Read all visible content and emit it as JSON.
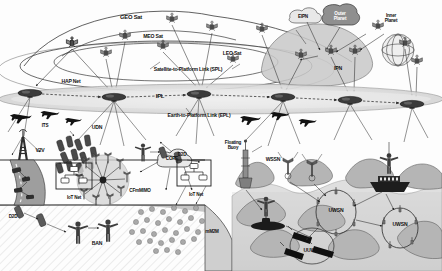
{
  "diagram": {
    "background_color": "#ffffff",
    "ink_color": "#1a1a1a",
    "band_fill": "#d8d8d8",
    "water_fill": "#bdbdbd",
    "cloud_fill": "#9a9a9a"
  },
  "labels": {
    "geo_sat": "GEO Sat",
    "meo_sat": "MEO Sat",
    "leo_sat": "LEO Sat",
    "spl": "Satellite-to-Platform Link (SPL)",
    "epl": "Earth-to-Platform Link (EPL)",
    "hap_net": "HAP Net",
    "ipl": "IPL",
    "eipn": "EIPN",
    "outer_planet": "Outer\nPlanet",
    "inner_planet": "Inner\nPlanet",
    "ipn": "IPN",
    "its": "ITS",
    "udn": "UDN",
    "v2v": "V2V",
    "d2d_left": "D2D",
    "d2d_right": "D2D",
    "iot_net_left": "IoT Net",
    "iot_net_right": "IoT Net",
    "cfmmimo": "CFmMIMO",
    "core": "CORE",
    "ban": "BAN",
    "mm2m": "mM2M",
    "floating_buoy": "Floating\nBuoy",
    "wssn": "WSSN",
    "uwsn_1": "UWSN",
    "uwsn_2": "UWSN",
    "uuwv": "UUWV"
  },
  "nodes": {
    "satellites": [
      {
        "name": "geo-satellite-1",
        "x": 72,
        "y": 43
      },
      {
        "name": "geo-satellite-2",
        "x": 172,
        "y": 19
      },
      {
        "name": "meo-satellite-1",
        "x": 125,
        "y": 36
      },
      {
        "name": "meo-satellite-2",
        "x": 163,
        "y": 46
      },
      {
        "name": "leo-satellite-1",
        "x": 106,
        "y": 53
      },
      {
        "name": "leo-satellite-2",
        "x": 212,
        "y": 27
      },
      {
        "name": "leo-satellite-3",
        "x": 233,
        "y": 59
      },
      {
        "name": "leo-satellite-4",
        "x": 262,
        "y": 29
      },
      {
        "name": "ipn-satellite-1",
        "x": 301,
        "y": 55
      },
      {
        "name": "ipn-satellite-2",
        "x": 331,
        "y": 51
      },
      {
        "name": "ipn-satellite-3",
        "x": 355,
        "y": 51
      },
      {
        "name": "ipn-satellite-4",
        "x": 378,
        "y": 26
      },
      {
        "name": "ipn-satellite-5",
        "x": 405,
        "y": 43
      },
      {
        "name": "ipn-satellite-6",
        "x": 417,
        "y": 61
      }
    ],
    "hap_platforms": [
      {
        "name": "hap-platform-1",
        "x": 30,
        "y": 93
      },
      {
        "name": "hap-platform-2",
        "x": 114,
        "y": 97
      },
      {
        "name": "hap-platform-3",
        "x": 199,
        "y": 94
      },
      {
        "name": "hap-platform-4",
        "x": 283,
        "y": 97
      },
      {
        "name": "hap-platform-5",
        "x": 350,
        "y": 100
      },
      {
        "name": "hap-platform-6",
        "x": 412,
        "y": 104
      }
    ],
    "aircraft": [
      {
        "name": "aircraft-1",
        "x": 22,
        "y": 120
      },
      {
        "name": "aircraft-2",
        "x": 50,
        "y": 117
      },
      {
        "name": "aircraft-3",
        "x": 75,
        "y": 122
      },
      {
        "name": "aircraft-4",
        "x": 252,
        "y": 122
      },
      {
        "name": "aircraft-5",
        "x": 283,
        "y": 118
      },
      {
        "name": "aircraft-6",
        "x": 311,
        "y": 124
      }
    ]
  },
  "regions": {
    "space": "satellite constellations and interplanetary networks",
    "air": "high altitude platform network band",
    "ground": "terrestrial cellular, vehicular and IoT networks",
    "sea": "surface and underwater acoustic sensor networks"
  }
}
